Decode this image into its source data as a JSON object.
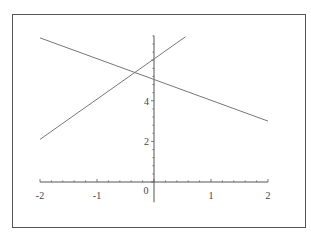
{
  "chart_data": {
    "type": "line",
    "title": "",
    "xlabel": "",
    "ylabel": "",
    "xlim": [
      -2,
      2
    ],
    "ylim": [
      -1,
      7.2
    ],
    "grid": false,
    "legend": null,
    "x_ticks": [
      -2,
      -1,
      0,
      1,
      2
    ],
    "x_tick_labels": [
      "-2",
      "-1",
      "0",
      "1",
      "2"
    ],
    "y_ticks": [
      2,
      4
    ],
    "y_tick_labels": [
      "2",
      "4"
    ],
    "series": [
      {
        "name": "line-decreasing",
        "equation_estimate": "y = -x + 5",
        "x": [
          -2,
          2
        ],
        "y": [
          7.1,
          3.0
        ],
        "color": "#777777"
      },
      {
        "name": "line-increasing",
        "equation_estimate": "y = 2x + 6",
        "x": [
          -2,
          0.55
        ],
        "y": [
          2.1,
          7.15
        ],
        "color": "#777777"
      }
    ],
    "intersection_estimate": {
      "x": -0.33,
      "y": 5.35
    }
  },
  "colors": {
    "axis": "#555555",
    "frame": "#555555",
    "line": "#777777"
  }
}
